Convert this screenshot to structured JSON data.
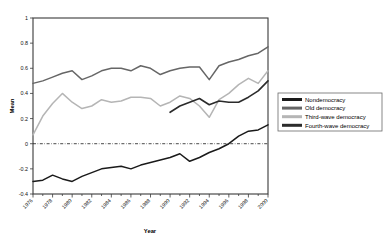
{
  "chart_data": {
    "type": "line",
    "title": "",
    "xlabel": "Year",
    "ylabel": "Mean",
    "xlim": [
      1976,
      2000
    ],
    "ylim": [
      -0.4,
      1.0
    ],
    "grid": false,
    "legend_position": "right",
    "zero_reference_line": 0,
    "x": [
      1976,
      1977,
      1978,
      1979,
      1980,
      1981,
      1982,
      1983,
      1984,
      1985,
      1986,
      1987,
      1988,
      1989,
      1990,
      1991,
      1992,
      1993,
      1994,
      1995,
      1996,
      1997,
      1998,
      1999,
      2000
    ],
    "xticks": [
      1976,
      1978,
      1980,
      1982,
      1984,
      1986,
      1988,
      1990,
      1992,
      1994,
      1996,
      1998,
      2000
    ],
    "xticklabels": [
      "1976",
      "1978",
      "1980",
      "1982",
      "1984",
      "1986",
      "1988",
      "1990",
      "1992",
      "1994",
      "1996",
      "1998",
      "2000"
    ],
    "yticks": [
      -0.4,
      -0.2,
      0,
      0.2,
      0.4,
      0.6,
      0.8,
      1
    ],
    "yticklabels": [
      "-0.4",
      "-0.2",
      "0",
      "0.2",
      "0.4",
      "0.6",
      "0.8",
      "1"
    ],
    "series": [
      {
        "name": "Nondemocracy",
        "color": "#1a1a1a",
        "width": 1.5,
        "x": [
          1976,
          1977,
          1978,
          1979,
          1980,
          1981,
          1982,
          1983,
          1984,
          1985,
          1986,
          1987,
          1988,
          1989,
          1990,
          1991,
          1992,
          1993,
          1994,
          1995,
          1996,
          1997,
          1998,
          1999,
          2000
        ],
        "values": [
          -0.3,
          -0.29,
          -0.25,
          -0.28,
          -0.3,
          -0.26,
          -0.23,
          -0.2,
          -0.19,
          -0.18,
          -0.2,
          -0.17,
          -0.15,
          -0.13,
          -0.11,
          -0.08,
          -0.14,
          -0.11,
          -0.07,
          -0.04,
          0.0,
          0.06,
          0.1,
          0.11,
          0.15
        ]
      },
      {
        "name": "Old democracy",
        "color": "#666666",
        "width": 1.5,
        "x": [
          1976,
          1977,
          1978,
          1979,
          1980,
          1981,
          1982,
          1983,
          1984,
          1985,
          1986,
          1987,
          1988,
          1989,
          1990,
          1991,
          1992,
          1993,
          1994,
          1995,
          1996,
          1997,
          1998,
          1999,
          2000
        ],
        "values": [
          0.48,
          0.5,
          0.53,
          0.56,
          0.58,
          0.51,
          0.54,
          0.58,
          0.6,
          0.6,
          0.58,
          0.62,
          0.6,
          0.55,
          0.58,
          0.6,
          0.61,
          0.61,
          0.51,
          0.62,
          0.65,
          0.67,
          0.7,
          0.72,
          0.77
        ]
      },
      {
        "name": "Third-wave democracy",
        "color": "#b5b5b5",
        "width": 1.5,
        "x": [
          1976,
          1977,
          1978,
          1979,
          1980,
          1981,
          1982,
          1983,
          1984,
          1985,
          1986,
          1987,
          1988,
          1989,
          1990,
          1991,
          1992,
          1993,
          1994,
          1995,
          1996,
          1997,
          1998,
          1999,
          2000
        ],
        "values": [
          0.07,
          0.22,
          0.32,
          0.4,
          0.33,
          0.28,
          0.3,
          0.35,
          0.33,
          0.34,
          0.37,
          0.37,
          0.36,
          0.3,
          0.33,
          0.38,
          0.36,
          0.3,
          0.21,
          0.35,
          0.4,
          0.47,
          0.52,
          0.48,
          0.58
        ]
      },
      {
        "name": "Fourth-wave democracy",
        "color": "#2b2b2b",
        "width": 1.6,
        "x": [
          1990,
          1991,
          1992,
          1993,
          1994,
          1995,
          1996,
          1997,
          1998,
          1999,
          2000
        ],
        "values": [
          0.25,
          0.3,
          0.33,
          0.36,
          0.31,
          0.34,
          0.33,
          0.33,
          0.37,
          0.42,
          0.5
        ]
      }
    ]
  },
  "legend": {
    "entries": [
      {
        "label": "Nondemocracy",
        "color": "#1a1a1a"
      },
      {
        "label": "Old democracy",
        "color": "#666666"
      },
      {
        "label": "Third-wave democracy",
        "color": "#b5b5b5"
      },
      {
        "label": "Fourth-wave democracy",
        "color": "#2b2b2b"
      }
    ]
  }
}
